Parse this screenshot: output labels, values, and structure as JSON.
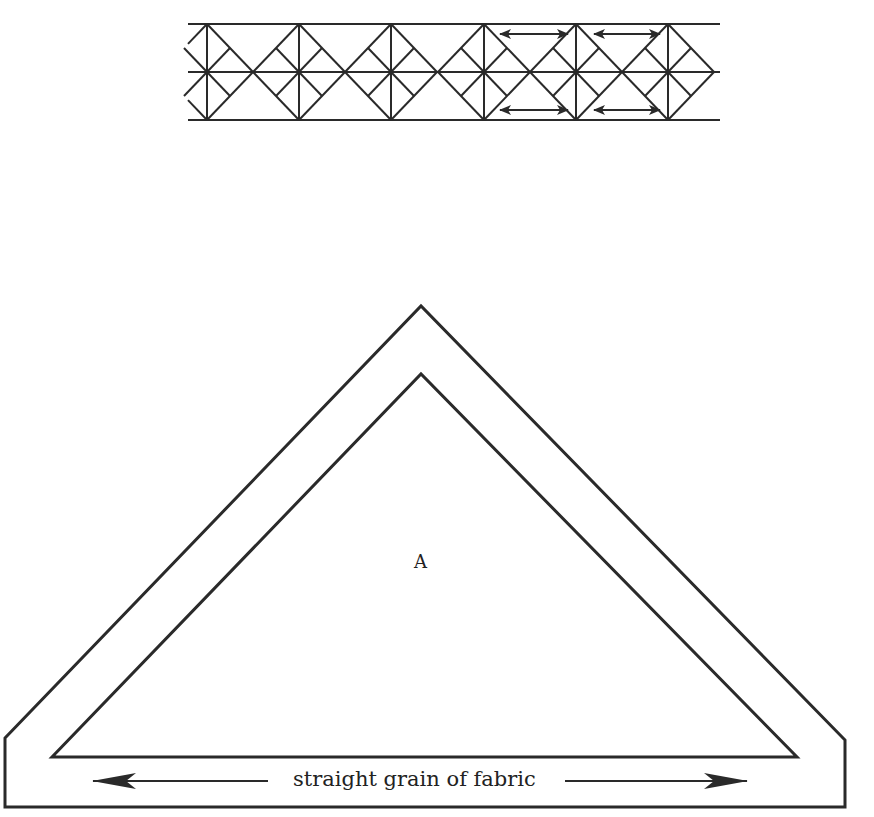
{
  "diagram": {
    "top_strip": {
      "description": "quilt border strip of quartered diamond blocks with grain arrows",
      "rows_y": [
        24,
        72,
        120
      ],
      "x_start": 188,
      "x_end": 720,
      "block_centers_x": [
        207,
        299,
        391,
        484,
        576,
        668
      ],
      "half_width": 46,
      "grain_arrows": [
        {
          "x1": 500,
          "x2": 568,
          "y": 34
        },
        {
          "x1": 594,
          "x2": 660,
          "y": 34
        },
        {
          "x1": 500,
          "x2": 568,
          "y": 110
        },
        {
          "x1": 594,
          "x2": 660,
          "y": 110
        }
      ]
    },
    "template": {
      "piece_label": "A",
      "grain_text": "straight grain of fabric",
      "outer_outline": [
        [
          5,
          738
        ],
        [
          421,
          306
        ],
        [
          845,
          740
        ],
        [
          845,
          807
        ],
        [
          5,
          807
        ]
      ],
      "inner_outline": [
        [
          52,
          757
        ],
        [
          421,
          374
        ],
        [
          797,
          757
        ]
      ]
    },
    "colors": {
      "line": "#2a2a2a",
      "background": "#ffffff"
    }
  }
}
